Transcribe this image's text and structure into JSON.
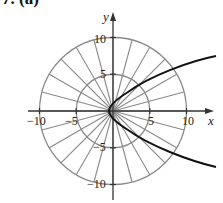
{
  "header": {
    "label": "7. (a)"
  },
  "graph": {
    "type": "polar-grid-with-curve",
    "x_axis_label": "x",
    "y_axis_label": "y",
    "x_ticks": [
      {
        "value": -10,
        "label": "−10"
      },
      {
        "value": -5,
        "label": "−5"
      },
      {
        "value": 5,
        "label": "5"
      },
      {
        "value": 10,
        "label": "10"
      }
    ],
    "y_ticks": [
      {
        "value": 10,
        "label": "10"
      },
      {
        "value": 5,
        "label": "5"
      },
      {
        "value": -5,
        "label": "−5"
      },
      {
        "value": -10,
        "label": "−10"
      }
    ],
    "polar_grid": {
      "radii": [
        5,
        10
      ],
      "spoke_step_deg": 15
    },
    "curve": {
      "description": "parabola opening right, vertex near origin",
      "color": "#111111"
    },
    "colors": {
      "grid": "#8a8a8a",
      "axis": "#333333",
      "curve": "#111111"
    }
  }
}
